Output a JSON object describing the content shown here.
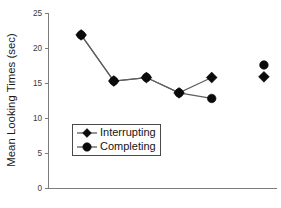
{
  "chart_data": {
    "type": "line",
    "title": "",
    "subtitle": "",
    "xlabel": "",
    "ylabel": "Mean Looking Times (sec)",
    "ylim": [
      0,
      25
    ],
    "yticks": [
      0,
      5,
      10,
      15,
      20,
      25
    ],
    "ytick_labels": [
      "0",
      "5",
      "10",
      "15",
      "20",
      "25"
    ],
    "xlim": [
      0,
      7
    ],
    "xticks": [],
    "xtick_labels": [],
    "grid": false,
    "legend_position": "center-left-inside",
    "x": [
      1,
      2,
      3,
      4,
      5,
      6.6
    ],
    "series": [
      {
        "name": "Interrupting",
        "marker": "diamond",
        "values": [
          22.0,
          15.4,
          15.9,
          13.7,
          15.9,
          16.0
        ],
        "connected_through": [
          1,
          2,
          3,
          4,
          5
        ],
        "isolated_points": [
          {
            "x": 6.6,
            "y": 16.0
          }
        ]
      },
      {
        "name": "Completing",
        "marker": "circle",
        "values": [
          22.0,
          15.4,
          15.9,
          13.7,
          12.9,
          17.7
        ],
        "connected_through": [
          1,
          2,
          3,
          4,
          5
        ],
        "isolated_points": [
          {
            "x": 6.6,
            "y": 17.7
          }
        ]
      }
    ],
    "annotations": [
      "Interrupting and Completing series overlap at the first four x positions",
      "Rightmost pair of points is plotted without a connecting line"
    ],
    "colors": {
      "marker": "#0b0b0b",
      "line": "#5f5f5f",
      "axis": "#7c7c7c",
      "text": "#141414",
      "background": "#ffffff"
    }
  },
  "legend": {
    "entries": [
      {
        "label": "Interrupting",
        "marker": "diamond"
      },
      {
        "label": "Completing",
        "marker": "circle"
      }
    ]
  },
  "axes": {
    "y_title": "Mean Looking Times (sec)",
    "y_tick_0": "0",
    "y_tick_5": "5",
    "y_tick_10": "10",
    "y_tick_15": "15",
    "y_tick_20": "20",
    "y_tick_25": "25"
  }
}
